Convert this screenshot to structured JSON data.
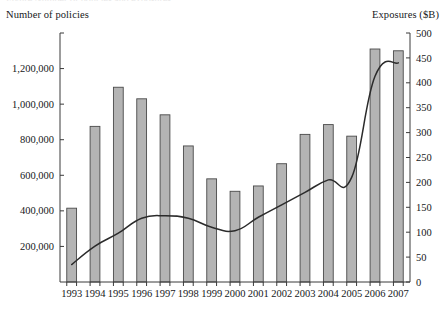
{
  "figure": {
    "cut_off_top_line": "Figure  Number of policies and exposures",
    "left_axis_title": "Number of policies",
    "right_axis_title": "Exposures ($B)"
  },
  "chart_data": {
    "type": "bar",
    "title": "",
    "subtitle": "",
    "xlabel": "",
    "ylabel": "Number of policies",
    "y2label": "Exposures ($B)",
    "grid": false,
    "legend": "none",
    "categories": [
      "1993",
      "1994",
      "1995",
      "1996",
      "1997",
      "1998",
      "1999",
      "2000",
      "2001",
      "2002",
      "2003",
      "2004",
      "2005",
      "2006",
      "2007"
    ],
    "ylim": [
      0,
      1400000
    ],
    "y2lim": [
      0,
      500
    ],
    "yticks": [
      200000,
      400000,
      600000,
      800000,
      1000000,
      1200000
    ],
    "ytick_labels": [
      "200,000",
      "400,000",
      "600,000",
      "800,000",
      "1,000,000",
      "1,200,000"
    ],
    "y2ticks": [
      0,
      50,
      100,
      150,
      200,
      250,
      300,
      350,
      400,
      450,
      500
    ],
    "y2tick_labels": [
      "0",
      "50",
      "100",
      "150",
      "200",
      "250",
      "300",
      "350",
      "400",
      "450",
      "500"
    ],
    "series": [
      {
        "name": "Number of policies",
        "type": "bar",
        "axis": "left",
        "color": "#b4b4b4",
        "edge_color": "#4a4a4a",
        "values": [
          415000,
          875000,
          1095000,
          1030000,
          940000,
          765000,
          580000,
          510000,
          540000,
          665000,
          830000,
          885000,
          820000,
          1310000,
          1300000
        ]
      },
      {
        "name": "Exposures ($B)",
        "type": "line",
        "axis": "right",
        "color": "#2b2b2b",
        "values": [
          35,
          72,
          98,
          128,
          133,
          128,
          110,
          103,
          130,
          155,
          180,
          205,
          210,
          413,
          440
        ]
      }
    ]
  },
  "geometry": {
    "plot_left": 60,
    "plot_right": 410,
    "plot_top": 33,
    "plot_bottom": 282,
    "bar_width_ratio": 0.42
  }
}
